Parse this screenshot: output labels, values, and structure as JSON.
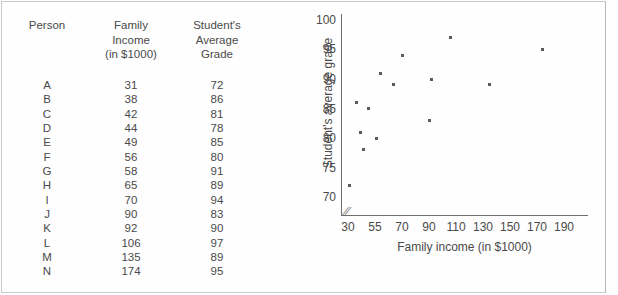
{
  "table": {
    "headers": {
      "person": "Person",
      "income": "Family\nIncome\n(in $1000)",
      "grade": "Student's\nAverage\nGrade"
    },
    "rows": [
      {
        "person": "A",
        "income": "31",
        "grade": "72"
      },
      {
        "person": "B",
        "income": "38",
        "grade": "86"
      },
      {
        "person": "C",
        "income": "42",
        "grade": "81"
      },
      {
        "person": "D",
        "income": "44",
        "grade": "78"
      },
      {
        "person": "E",
        "income": "49",
        "grade": "85"
      },
      {
        "person": "F",
        "income": "56",
        "grade": "80"
      },
      {
        "person": "G",
        "income": "58",
        "grade": "91"
      },
      {
        "person": "H",
        "income": "65",
        "grade": "89"
      },
      {
        "person": "I",
        "income": "70",
        "grade": "94"
      },
      {
        "person": "J",
        "income": "90",
        "grade": "83"
      },
      {
        "person": "K",
        "income": "92",
        "grade": "90"
      },
      {
        "person": "L",
        "income": "106",
        "grade": "97"
      },
      {
        "person": "M",
        "income": "135",
        "grade": "89"
      },
      {
        "person": "N",
        "income": "174",
        "grade": "95"
      }
    ]
  },
  "chart_data": {
    "type": "scatter",
    "title": "",
    "xlabel": "Family income (in $1000)",
    "ylabel": "Student's average grade",
    "grid": false,
    "legend": null,
    "axis_break": "//",
    "x_ticks": [
      30,
      55,
      70,
      90,
      110,
      130,
      150,
      170,
      190
    ],
    "x_tick_labels": [
      "30",
      "55",
      "70",
      "90",
      "110",
      "130",
      "150",
      "170",
      "190"
    ],
    "y_ticks": [
      70,
      75,
      80,
      85,
      90,
      95,
      100
    ],
    "y_tick_labels": [
      "70",
      "75",
      "80",
      "85",
      "90",
      "95",
      "100"
    ],
    "ylim": [
      67,
      101
    ],
    "x_scale": "non-uniform (ticks evenly spaced in pixels)",
    "points": [
      {
        "label": "A",
        "x": 31,
        "y": 72
      },
      {
        "label": "B",
        "x": 38,
        "y": 86
      },
      {
        "label": "C",
        "x": 42,
        "y": 81
      },
      {
        "label": "D",
        "x": 44,
        "y": 78
      },
      {
        "label": "E",
        "x": 49,
        "y": 85
      },
      {
        "label": "F",
        "x": 56,
        "y": 80
      },
      {
        "label": "G",
        "x": 58,
        "y": 91
      },
      {
        "label": "H",
        "x": 65,
        "y": 89
      },
      {
        "label": "I",
        "x": 70,
        "y": 94
      },
      {
        "label": "J",
        "x": 90,
        "y": 83
      },
      {
        "label": "K",
        "x": 92,
        "y": 90
      },
      {
        "label": "L",
        "x": 106,
        "y": 97
      },
      {
        "label": "M",
        "x": 135,
        "y": 89
      },
      {
        "label": "N",
        "x": 174,
        "y": 95
      }
    ],
    "colors": {
      "marker": "#5a5a5e",
      "axis": "#6e6e6e",
      "text": "#4a4a4a",
      "background": "#fefefe"
    }
  }
}
